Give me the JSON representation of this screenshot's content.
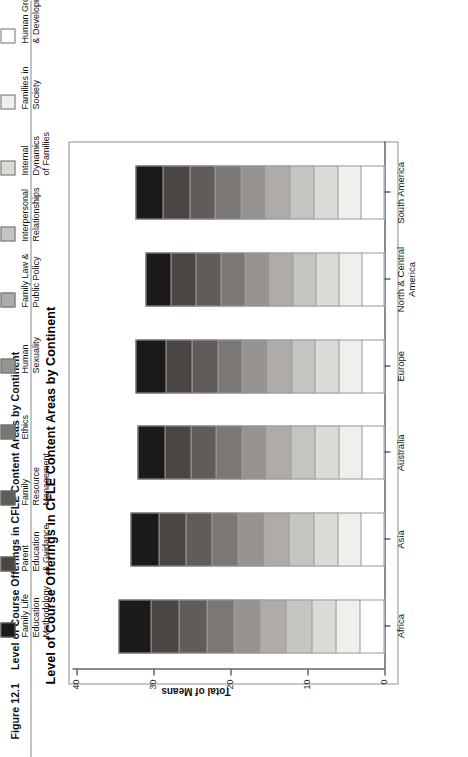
{
  "figure": {
    "number": "Figure 12.1",
    "caption": "Level of Course Offerings in CFLE Content Areas by Continent"
  },
  "chart_data": {
    "type": "bar",
    "stacked": true,
    "orientation": "vertical",
    "title": "Level of Course Offerings in CFLE Content Areas by Continent",
    "xlabel": "",
    "ylabel": "Total of Means",
    "ylim": [
      0,
      40
    ],
    "yticks": [
      0,
      10,
      20,
      30,
      40
    ],
    "grid": false,
    "legend_position": "top",
    "categories": [
      "Africa",
      "Asia",
      "Australia",
      "Europe",
      "North & Central America",
      "South America"
    ],
    "series": [
      {
        "name": "Family Life Education Methodology",
        "color": "#1c1a19",
        "values": [
          4.3,
          3.8,
          3.6,
          4.0,
          3.4,
          3.6
        ]
      },
      {
        "name": "Parent Education & Guidance",
        "color": "#4b4644",
        "values": [
          3.6,
          3.5,
          3.4,
          3.4,
          3.3,
          3.5
        ]
      },
      {
        "name": "Family Resource Management",
        "color": "#615c59",
        "values": [
          3.6,
          3.4,
          3.3,
          3.3,
          3.2,
          3.3
        ]
      },
      {
        "name": "Ethics",
        "color": "#7b7774",
        "values": [
          3.5,
          3.4,
          3.3,
          3.2,
          3.2,
          3.3
        ]
      },
      {
        "name": "Human Sexuality",
        "color": "#969390",
        "values": [
          3.4,
          3.3,
          3.2,
          3.2,
          3.1,
          3.2
        ]
      },
      {
        "name": "Family Law & Public Policy",
        "color": "#aeabA8",
        "values": [
          3.4,
          3.3,
          3.2,
          3.2,
          3.1,
          3.2
        ]
      },
      {
        "name": "Interpersonal Relationships",
        "color": "#c6c4c1",
        "values": [
          3.3,
          3.2,
          3.1,
          3.1,
          3.0,
          3.1
        ]
      },
      {
        "name": "Internal Dynamics of Families",
        "color": "#dcdbd8",
        "values": [
          3.2,
          3.1,
          3.1,
          3.0,
          3.0,
          3.1
        ]
      },
      {
        "name": "Families in Society",
        "color": "#efefec",
        "values": [
          3.1,
          3.0,
          3.0,
          3.0,
          2.9,
          3.0
        ]
      },
      {
        "name": "Human Growth & Development",
        "color": "#ffffff",
        "values": [
          3.1,
          3.0,
          2.9,
          2.9,
          2.9,
          3.0
        ]
      }
    ],
    "totals": [
      34.5,
      33.0,
      32.1,
      32.3,
      31.1,
      32.3
    ],
    "legend": [
      "Family Life Education\nMethodology",
      "Parent Education\n& Guidance",
      "Family Resource\nManagement",
      "Ethics",
      "Human Sexuality",
      "Family Law &\nPublic Policy",
      "Interpersonal\nRelationships",
      "Internal Dynamics\nof Families",
      "Families in Society",
      "Human Growth\n& Development"
    ]
  }
}
